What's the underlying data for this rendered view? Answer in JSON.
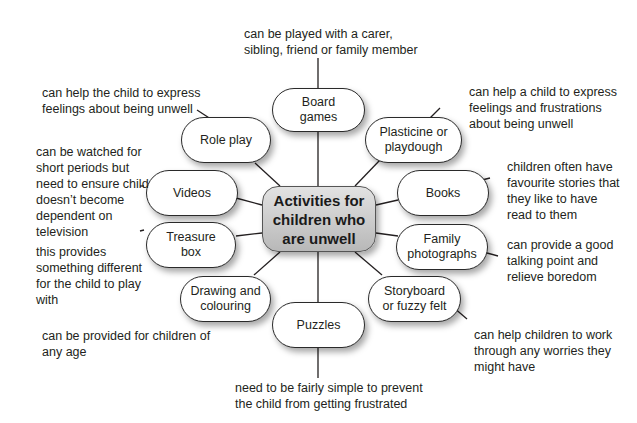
{
  "diagram": {
    "title": "Activities for children who are unwell",
    "nodes": [
      {
        "id": "board-games",
        "label": "Board games",
        "note": "can be played with a carer, sibling, friend or family member"
      },
      {
        "id": "plasticine",
        "label": "Plasticine or playdough",
        "note": "can help a child to express feelings and frustrations about being unwell"
      },
      {
        "id": "books",
        "label": "Books",
        "note": "children often have favourite stories that they like to have read to them"
      },
      {
        "id": "family-photographs",
        "label": "Family photographs",
        "note": "can provide a good talking point and relieve boredom"
      },
      {
        "id": "storyboard",
        "label": "Storyboard or fuzzy felt",
        "note": "can help children to work through any worries they might have"
      },
      {
        "id": "puzzles",
        "label": "Puzzles",
        "note": "need to be fairly simple to prevent the child from getting frustrated"
      },
      {
        "id": "drawing",
        "label": "Drawing and colouring",
        "note": "can be provided for children of any age"
      },
      {
        "id": "treasure-box",
        "label": "Treasure box",
        "note": "this provides something different for the child to play with"
      },
      {
        "id": "videos",
        "label": "Videos",
        "note": "can be watched for short periods but need to ensure child doesn’t become dependent on television"
      },
      {
        "id": "role-play",
        "label": "Role play",
        "note": "can help the child to express feelings about being unwell"
      }
    ]
  },
  "display": {
    "center": "Activities for\nchildren who\nare unwell",
    "board_games": "Board\ngames",
    "plasticine": "Plasticine or\nplaydough",
    "books": "Books",
    "family_photographs": "Family\nphotographs",
    "storyboard": "Storyboard\nor fuzzy felt",
    "puzzles": "Puzzles",
    "drawing": "Drawing and\ncolouring",
    "treasure_box": "Treasure\nbox",
    "videos": "Videos",
    "role_play": "Role play",
    "note_board_games": "can be played with a carer,\nsibling, friend or family member",
    "note_plasticine": "can help a child to express\nfeelings and frustrations\nabout being unwell",
    "note_books": "children often have\nfavourite stories that\nthey like to have\nread to them",
    "note_family_photographs": "can provide a good\ntalking point and\nrelieve boredom",
    "note_storyboard": "can help children to work\nthrough any worries they\nmight have",
    "note_puzzles": "need to be fairly simple to prevent\nthe child from getting frustrated",
    "note_drawing": "can be provided for children of\nany age",
    "note_treasure_box": "this provides\nsomething different\nfor the child to play\nwith",
    "note_videos": "can be watched for\nshort periods but\nneed to ensure child\ndoesn’t become\ndependent on\ntelevision",
    "note_role_play": "can help the child to express\nfeelings about being unwell"
  }
}
